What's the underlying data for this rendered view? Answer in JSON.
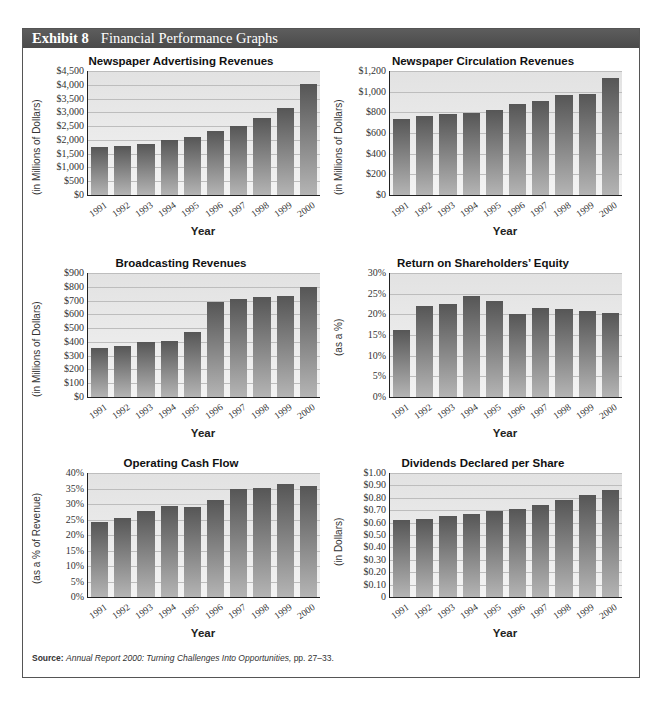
{
  "header": {
    "exhibit_label": "Exhibit 8",
    "title": "Financial Performance Graphs",
    "bg_color": "#535353"
  },
  "source": {
    "label": "Source:",
    "title": "Annual Report 2000: Turning Challenges Into Opportunities,",
    "pages": " pp. 27–33."
  },
  "chart_data": [
    {
      "type": "bar",
      "title": "Newspaper Advertising Revenues",
      "xlabel": "Year",
      "ylabel": "(in Millions of Dollars)",
      "categories": [
        "1991",
        "1992",
        "1993",
        "1994",
        "1995",
        "1996",
        "1997",
        "1998",
        "1999",
        "2000"
      ],
      "values": [
        1750,
        1780,
        1850,
        2000,
        2090,
        2310,
        2510,
        2810,
        3160,
        4020
      ],
      "ylim": [
        0,
        4500
      ],
      "yticks": [
        "$0",
        "$500",
        "$1,000",
        "$1,500",
        "$2,000",
        "$2,500",
        "$3,000",
        "$3,500",
        "$4,000",
        "$4,500"
      ],
      "grid": true
    },
    {
      "type": "bar",
      "title": "Newspaper Circulation Revenues",
      "xlabel": "Year",
      "ylabel": "(in Millions of Dollars)",
      "categories": [
        "1991",
        "1992",
        "1993",
        "1994",
        "1995",
        "1996",
        "1997",
        "1998",
        "1999",
        "2000"
      ],
      "values": [
        735,
        765,
        785,
        795,
        820,
        880,
        910,
        965,
        980,
        1130
      ],
      "ylim": [
        0,
        1200
      ],
      "yticks": [
        "$0",
        "$200",
        "$400",
        "$600",
        "$800",
        "$1,000",
        "$1,200"
      ],
      "grid": true
    },
    {
      "type": "bar",
      "title": "Broadcasting Revenues",
      "xlabel": "Year",
      "ylabel": "(in Millions of Dollars)",
      "categories": [
        "1991",
        "1992",
        "1993",
        "1994",
        "1995",
        "1996",
        "1997",
        "1998",
        "1999",
        "2000"
      ],
      "values": [
        355,
        370,
        400,
        410,
        470,
        690,
        710,
        725,
        735,
        795
      ],
      "ylim": [
        0,
        900
      ],
      "yticks": [
        "$0",
        "$100",
        "$200",
        "$300",
        "$400",
        "$500",
        "$600",
        "$700",
        "$800",
        "$900"
      ],
      "grid": true
    },
    {
      "type": "bar",
      "title": "Return on Shareholders’ Equity",
      "xlabel": "Year",
      "ylabel": "(as a %)",
      "categories": [
        "1991",
        "1992",
        "1993",
        "1994",
        "1995",
        "1996",
        "1997",
        "1998",
        "1999",
        "2000"
      ],
      "values": [
        16.2,
        22.0,
        22.4,
        24.5,
        23.2,
        20.0,
        21.5,
        21.2,
        20.8,
        20.3
      ],
      "ylim": [
        0,
        30
      ],
      "yticks": [
        "0%",
        "5%",
        "10%",
        "15%",
        "20%",
        "25%",
        "30%"
      ],
      "grid": true
    },
    {
      "type": "bar",
      "title": "Operating Cash Flow",
      "xlabel": "Year",
      "ylabel": "(as a % of Revenue)",
      "categories": [
        "1991",
        "1992",
        "1993",
        "1994",
        "1995",
        "1996",
        "1997",
        "1998",
        "1999",
        "2000"
      ],
      "values": [
        24.3,
        25.6,
        27.8,
        29.2,
        28.9,
        31.2,
        35.0,
        35.2,
        36.6,
        35.7
      ],
      "ylim": [
        0,
        40
      ],
      "yticks": [
        "0%",
        "5%",
        "10%",
        "15%",
        "20%",
        "25%",
        "30%",
        "35%",
        "40%"
      ],
      "grid": true
    },
    {
      "type": "bar",
      "title": "Dividends Declared per Share",
      "xlabel": "Year",
      "ylabel": "(in Dollars)",
      "categories": [
        "1991",
        "1992",
        "1993",
        "1994",
        "1995",
        "1996",
        "1997",
        "1998",
        "1999",
        "2000"
      ],
      "values": [
        0.62,
        0.63,
        0.65,
        0.67,
        0.69,
        0.71,
        0.74,
        0.78,
        0.82,
        0.86
      ],
      "ylim": [
        0,
        1.0
      ],
      "yticks": [
        "0",
        "$0.10",
        "$0.20",
        "$0.30",
        "$0.40",
        "$0.50",
        "$0.60",
        "$0.70",
        "$0.80",
        "$0.90",
        "$1.00"
      ],
      "grid": true
    }
  ]
}
